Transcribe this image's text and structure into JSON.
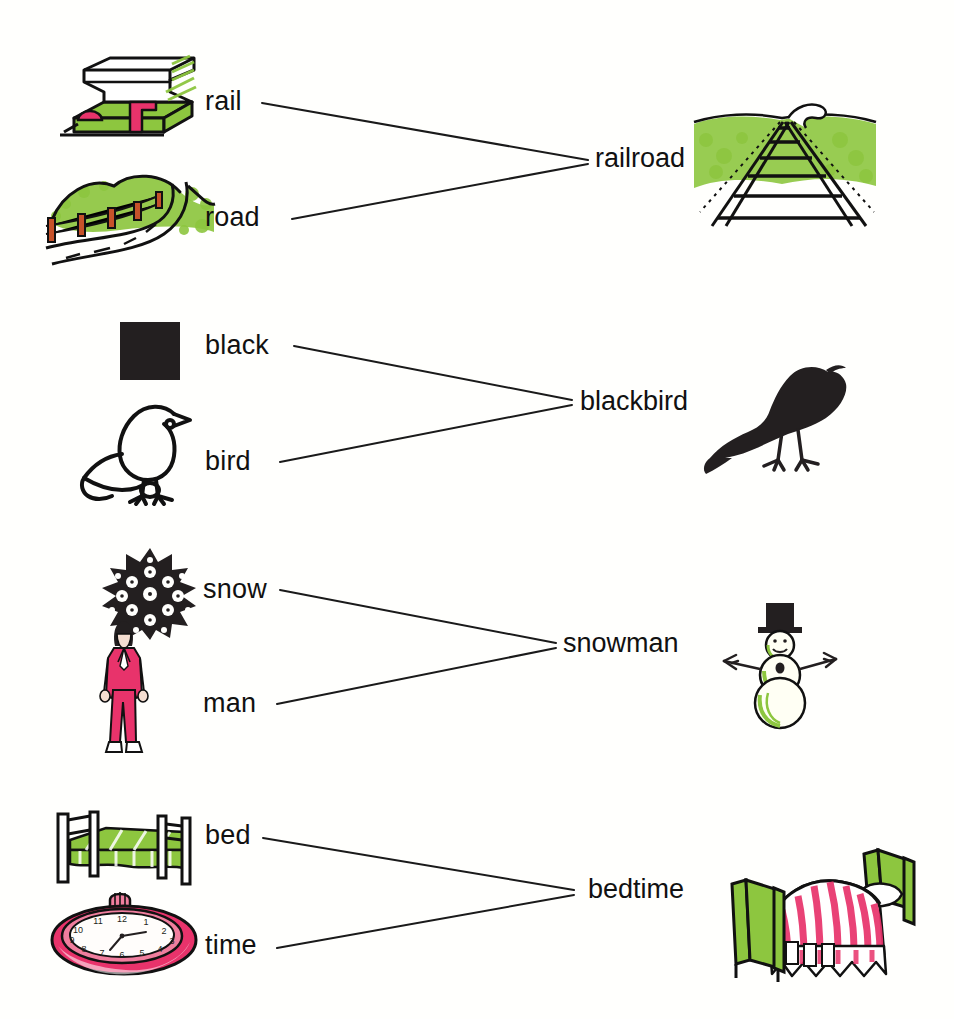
{
  "palette": {
    "ink": "#111111",
    "green": "#8DC63F",
    "green_dark": "#76a828",
    "pink": "#E8336B",
    "pink_light": "#F07E9E",
    "black": "#231f20",
    "paper": "#fffffd"
  },
  "rows": [
    {
      "id": "railroad",
      "part1": {
        "label": "rail",
        "icon": "rail-icon"
      },
      "part2": {
        "label": "road",
        "icon": "road-icon"
      },
      "compound": {
        "label": "railroad",
        "icon": "railroad-track-icon"
      }
    },
    {
      "id": "blackbird",
      "part1": {
        "label": "black",
        "icon": "black-square-icon"
      },
      "part2": {
        "label": "bird",
        "icon": "bird-outline-icon"
      },
      "compound": {
        "label": "blackbird",
        "icon": "blackbird-silhouette-icon"
      }
    },
    {
      "id": "snowman",
      "part1": {
        "label": "snow",
        "icon": "snowflake-icon"
      },
      "part2": {
        "label": "man",
        "icon": "man-icon"
      },
      "compound": {
        "label": "snowman",
        "icon": "snowman-icon"
      }
    },
    {
      "id": "bedtime",
      "part1": {
        "label": "bed",
        "icon": "bed-icon"
      },
      "part2": {
        "label": "time",
        "icon": "clock-icon"
      },
      "compound": {
        "label": "bedtime",
        "icon": "bed-sleeping-icon"
      }
    }
  ]
}
